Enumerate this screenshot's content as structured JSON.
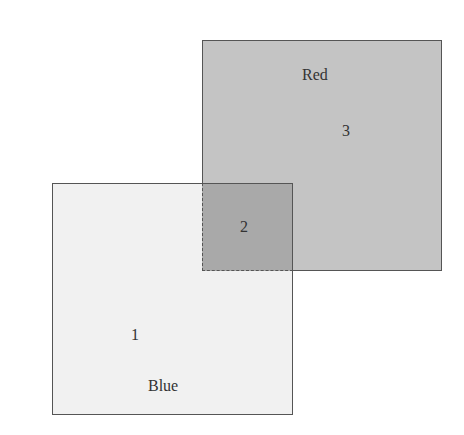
{
  "diagram": {
    "regions": [
      {
        "id": "1",
        "set": "Blue",
        "label": "1"
      },
      {
        "id": "2",
        "set": "intersection",
        "label": "2"
      },
      {
        "id": "3",
        "set": "Red",
        "label": "3"
      }
    ],
    "sets": {
      "red": {
        "name": "Red",
        "color": "#c4c4c4"
      },
      "blue": {
        "name": "Blue",
        "color": "#f1f1f1"
      },
      "overlap_color": "#a9a9a9"
    }
  }
}
